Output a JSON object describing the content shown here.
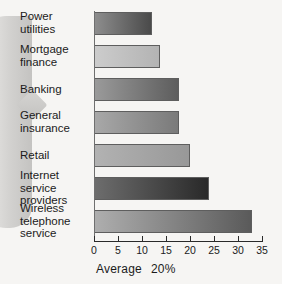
{
  "chart_data": {
    "type": "bar",
    "orientation": "horizontal",
    "title": "",
    "subtitle": "",
    "xlabel": "Average   20%",
    "ylabel": "",
    "xlim": [
      0,
      35
    ],
    "xticks": [
      0,
      5,
      10,
      15,
      20,
      25,
      30,
      35
    ],
    "grid": false,
    "legend": null,
    "categories": [
      "Power\nutilities",
      "Mortgage\nfinance",
      "Banking",
      "General\ninsurance",
      "Retail",
      "Internet\nservice\nproviders",
      "Wireless\ntelephone\nservice"
    ],
    "values": [
      12,
      13.7,
      17.7,
      17.7,
      20,
      24,
      33
    ],
    "bar_fills": [
      {
        "from": "#8d8d8d",
        "to": "#4a4a4a"
      },
      {
        "from": "#cccccc",
        "to": "#b3b3b3"
      },
      {
        "from": "#9a9a9a",
        "to": "#5d5d5d"
      },
      {
        "from": "#a8a8a8",
        "to": "#7a7a7a"
      },
      {
        "from": "#b2b2b2",
        "to": "#989898"
      },
      {
        "from": "#6d6d6d",
        "to": "#292929"
      },
      {
        "from": "#aeaeae",
        "to": "#5a5a5a"
      }
    ]
  },
  "caption": {
    "label": "Average",
    "value": "20%"
  },
  "colors": {
    "background": "#f6f5f3",
    "axis": "#2a2a2a",
    "text": "#1b1b1b",
    "bar_border": "#5e5e5e"
  }
}
